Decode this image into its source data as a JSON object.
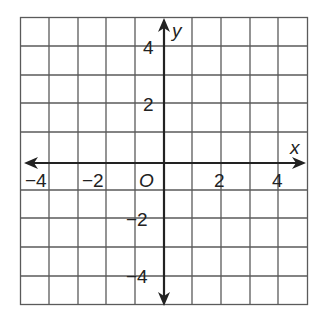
{
  "diagram": {
    "type": "coordinate-plane",
    "x_axis_label": "x",
    "y_axis_label": "y",
    "origin_label": "O",
    "x_tick_labels": [
      "−4",
      "−2",
      "2",
      "4"
    ],
    "y_tick_labels": [
      "4",
      "2",
      "−2",
      "−4"
    ],
    "grid": {
      "x_range": [
        -5,
        5
      ],
      "y_range": [
        -5,
        5
      ],
      "step": 1
    },
    "colors": {
      "grid": "#555555",
      "axis": "#222222",
      "background": "#ffffff"
    }
  }
}
